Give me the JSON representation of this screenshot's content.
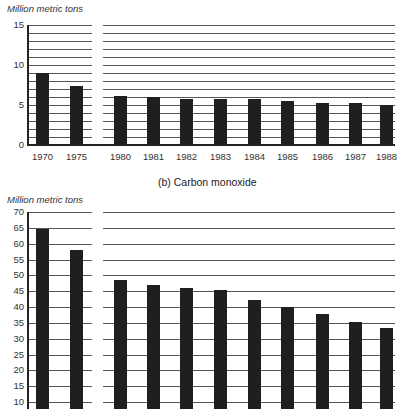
{
  "chart_data": [
    {
      "type": "bar",
      "title": "",
      "ylabel": "Million metric tons",
      "xlabel": "",
      "ylim": [
        0,
        15
      ],
      "yticks": [
        0,
        5,
        10,
        15
      ],
      "grid": true,
      "grid_step": 1,
      "categories": [
        "1970",
        "1975",
        "1980",
        "1981",
        "1982",
        "1983",
        "1984",
        "1985",
        "1986",
        "1987",
        "1988"
      ],
      "values": [
        9.0,
        7.4,
        6.1,
        6.0,
        5.8,
        5.8,
        5.8,
        5.5,
        5.3,
        5.2,
        5.0
      ]
    },
    {
      "type": "bar",
      "title": "(b) Carbon monoxide",
      "ylabel": "Million metric tons",
      "xlabel": "",
      "ylim": [
        10,
        70
      ],
      "yticks": [
        10,
        15,
        20,
        25,
        30,
        35,
        40,
        45,
        50,
        55,
        60,
        65,
        70
      ],
      "grid": true,
      "grid_step": 5,
      "categories": [
        "1970",
        "1975",
        "1980",
        "1981",
        "1982",
        "1983",
        "1984",
        "1985",
        "1986",
        "1987",
        "1988"
      ],
      "values": [
        64.5,
        57.9,
        48.6,
        47.1,
        46.1,
        45.5,
        42.2,
        39.9,
        37.7,
        35.4,
        33.4
      ]
    }
  ],
  "top_chart": {
    "ylabel": "Million metric tons"
  },
  "bottom_chart": {
    "ylabel": "Million metric tons",
    "subtitle": "(b) Carbon monoxide"
  },
  "colors": {
    "bar": "#1f1f1f",
    "grid": "#555555",
    "axis": "#222222"
  }
}
